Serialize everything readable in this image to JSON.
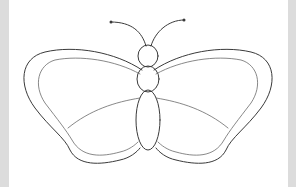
{
  "image": {
    "subject": "butterfly line drawing",
    "style": "pencil outline coloring page",
    "colors": {
      "background": "#ffffff",
      "border": "#dcdcdc",
      "stroke": "#3a3a3a"
    },
    "parts": [
      "left-antenna",
      "right-antenna",
      "head",
      "thorax",
      "abdomen",
      "left-forewing",
      "right-forewing",
      "left-hindwing",
      "right-hindwing"
    ]
  }
}
